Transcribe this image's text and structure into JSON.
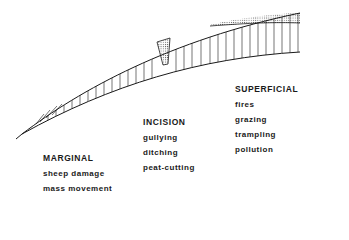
{
  "diagram": {
    "type": "peat surface erosion cross-section",
    "colors": {
      "line": "#1a1a1a",
      "stipple": "#555555",
      "background": "#ffffff"
    },
    "groups": [
      {
        "heading": "MARGINAL",
        "items": [
          "sheep damage",
          "mass movement"
        ]
      },
      {
        "heading": "INCISION",
        "items": [
          "gullying",
          "ditching",
          "peat-cutting"
        ]
      },
      {
        "heading": "SUPERFICIAL",
        "items": [
          "fires",
          "grazing",
          "trampling",
          "pollution"
        ]
      }
    ]
  }
}
